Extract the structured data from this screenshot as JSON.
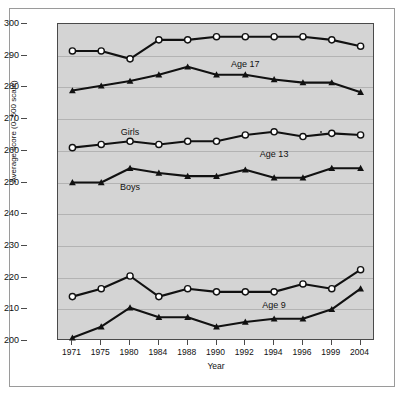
{
  "chart_data": {
    "type": "line",
    "title": "",
    "xlabel": "Year",
    "ylabel": "Average score (0–500 scale)",
    "categories": [
      "1971",
      "1975",
      "1980",
      "1984",
      "1988",
      "1990",
      "1992",
      "1994",
      "1996",
      "1999",
      "2004"
    ],
    "ylim": [
      200,
      300
    ],
    "yticks": [
      200,
      210,
      220,
      230,
      240,
      250,
      260,
      270,
      280,
      290,
      300
    ],
    "ytick_labels": [
      "200",
      "210",
      "220",
      "230",
      "240",
      "250",
      "260",
      "270",
      "280",
      "290",
      "300"
    ],
    "grid": "horizontal",
    "legend_position": "inline-annotations",
    "series": [
      {
        "name": "Age 17 Girls",
        "age_group": "Age 17",
        "sex": "Girls",
        "marker": "open-circle",
        "values": [
          291.5,
          291.5,
          289.0,
          295.0,
          295.0,
          296.0,
          296.0,
          296.0,
          296.0,
          295.0,
          293.0
        ]
      },
      {
        "name": "Age 17 Boys",
        "age_group": "Age 17",
        "sex": "Boys",
        "marker": "filled-triangle",
        "values": [
          279.0,
          280.5,
          282.0,
          284.0,
          286.5,
          284.0,
          284.0,
          282.5,
          281.5,
          281.5,
          278.5
        ]
      },
      {
        "name": "Age 13 Girls",
        "age_group": "Age 13",
        "sex": "Girls",
        "marker": "open-circle",
        "values": [
          261.0,
          262.0,
          263.0,
          262.0,
          263.0,
          263.0,
          265.0,
          266.0,
          264.5,
          265.5,
          265.0
        ]
      },
      {
        "name": "Age 13 Boys",
        "age_group": "Age 13",
        "sex": "Boys",
        "marker": "filled-triangle",
        "values": [
          250.0,
          250.0,
          254.5,
          253.0,
          252.0,
          252.0,
          254.0,
          251.5,
          251.5,
          254.5,
          254.5
        ]
      },
      {
        "name": "Age 9 Girls",
        "age_group": "Age 9",
        "sex": "Girls",
        "marker": "open-circle",
        "values": [
          214.0,
          216.5,
          220.5,
          214.0,
          216.5,
          215.5,
          215.5,
          215.5,
          218.0,
          216.5,
          222.5
        ]
      },
      {
        "name": "Age 9 Boys",
        "age_group": "Age 9",
        "sex": "Boys",
        "marker": "filled-triangle",
        "values": [
          201.0,
          204.5,
          210.5,
          207.5,
          207.5,
          204.5,
          206.0,
          207.0,
          207.0,
          210.0,
          216.5
        ]
      }
    ],
    "annotations": [
      {
        "text": "Age 17",
        "x_category": "1992",
        "y_value": 287.5
      },
      {
        "text": "Age 13",
        "x_category": "1994",
        "y_value": 259.0
      },
      {
        "text": "Age 9",
        "x_category": "1994",
        "y_value": 211.5
      },
      {
        "text": "Girls",
        "x_category": "1980",
        "y_value": 266.0
      },
      {
        "text": "Boys",
        "x_category": "1980",
        "y_value": 248.5
      }
    ],
    "colors": {
      "plot_background": "#d4d4d4",
      "figure_background": "#ffffff",
      "line": "#111111",
      "gridline": "#b3b3b3",
      "axis": "#4a4a4a",
      "marker_open_fill": "#ffffff",
      "text": "#111111"
    }
  }
}
